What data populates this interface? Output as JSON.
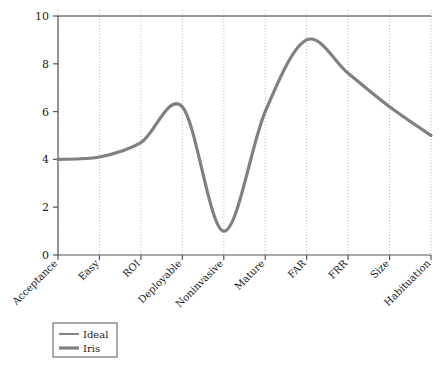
{
  "chart_data": {
    "type": "line",
    "title": "",
    "xlabel": "",
    "ylabel": "",
    "ylim": [
      0,
      10
    ],
    "yticks": [
      0,
      2,
      4,
      6,
      8,
      10
    ],
    "grid": "vertical-dotted",
    "categories": [
      "Acceptance",
      "Easy",
      "ROI",
      "Deployable",
      "Noninvasive",
      "Mature",
      "FAR",
      "FRR",
      "Size",
      "Habituation"
    ],
    "series": [
      {
        "name": "Ideal",
        "color": "#333333",
        "width": 1.2,
        "values": [
          10,
          10,
          10,
          10,
          10,
          10,
          10,
          10,
          10,
          10
        ]
      },
      {
        "name": "Iris",
        "color": "#808080",
        "width": 3.2,
        "values": [
          4,
          4.1,
          4.7,
          6.2,
          1.0,
          6.0,
          9.0,
          7.6,
          6.2,
          5.0
        ]
      }
    ],
    "legend": {
      "position": "below-left",
      "entries": [
        {
          "label": "Ideal",
          "color": "#333333",
          "width": 1.2
        },
        {
          "label": "Iris",
          "color": "#808080",
          "width": 3.2
        }
      ]
    },
    "axis": {
      "y_tick_labels": [
        "0",
        "2",
        "4",
        "6",
        "8",
        "10"
      ],
      "y_min_label": "0",
      "y_max_label": "10"
    }
  }
}
